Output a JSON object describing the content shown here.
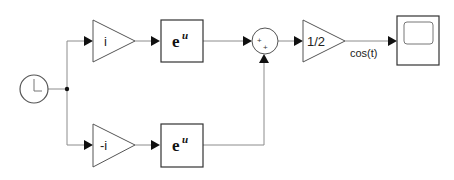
{
  "diagram": {
    "type": "simulink-block-diagram",
    "blocks": {
      "clock": {
        "name": "Clock",
        "icon": "clock-icon"
      },
      "gain_top": {
        "label": "i"
      },
      "gain_bottom": {
        "label": "-i"
      },
      "math_top": {
        "base": "e",
        "exponent": "u"
      },
      "math_bottom": {
        "base": "e",
        "exponent": "u"
      },
      "sum": {
        "signs": [
          "+",
          "+"
        ]
      },
      "gain_half": {
        "label": "1/2"
      },
      "scope": {
        "name": "Scope",
        "icon": "scope-icon"
      }
    },
    "signals": {
      "output_label": "cos(t)"
    },
    "colors": {
      "wire": "#8c8c8c",
      "block_border": "#555555",
      "arrow": "#111111",
      "background": "#ffffff"
    }
  }
}
